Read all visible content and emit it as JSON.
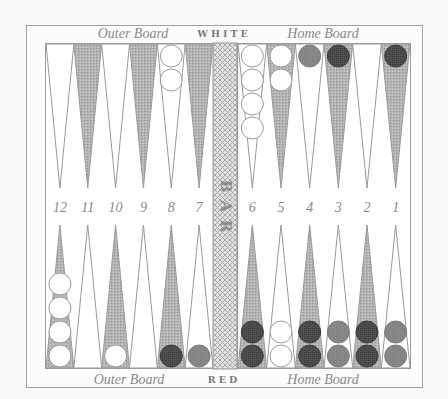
{
  "labels": {
    "top_left": "Outer Board",
    "top_center": "WHITE",
    "top_right": "Home Board",
    "bottom_left": "Outer Board",
    "bottom_center": "RED",
    "bottom_right": "Home Board",
    "bar": [
      "B",
      "A",
      "R"
    ]
  },
  "point_numbers": {
    "left": [
      "12",
      "11",
      "10",
      "9",
      "8",
      "7"
    ],
    "right": [
      "6",
      "5",
      "4",
      "3",
      "2",
      "1"
    ]
  },
  "colors": {
    "background": "#fafafa",
    "frame": "#9a9a9a",
    "shaded_point": "#a9a9a9",
    "light_point": "#ffffff",
    "bar": "#c8c8c8",
    "checker_white": "#ffffff",
    "checker_dark": "#4a4a4a",
    "checker_medium": "#858585"
  },
  "top_points": {
    "left": [
      {
        "shade": "light",
        "checkers": []
      },
      {
        "shade": "dark",
        "checkers": []
      },
      {
        "shade": "light",
        "checkers": []
      },
      {
        "shade": "dark",
        "checkers": []
      },
      {
        "shade": "light",
        "checkers": [
          "white",
          "white"
        ]
      },
      {
        "shade": "dark",
        "checkers": []
      }
    ],
    "right": [
      {
        "shade": "light",
        "checkers": [
          "white",
          "white",
          "white",
          "white"
        ]
      },
      {
        "shade": "dark",
        "checkers": [
          "white",
          "white"
        ]
      },
      {
        "shade": "light",
        "checkers": [
          "medium"
        ]
      },
      {
        "shade": "dark",
        "checkers": [
          "dark"
        ]
      },
      {
        "shade": "light",
        "checkers": []
      },
      {
        "shade": "dark",
        "checkers": [
          "dark"
        ]
      }
    ]
  },
  "bottom_points": {
    "left": [
      {
        "point": "12",
        "shade": "dark",
        "checkers": [
          "white",
          "white",
          "white",
          "white"
        ]
      },
      {
        "point": "11",
        "shade": "light",
        "checkers": []
      },
      {
        "point": "10",
        "shade": "dark",
        "checkers": [
          "white"
        ]
      },
      {
        "point": "9",
        "shade": "light",
        "checkers": []
      },
      {
        "point": "8",
        "shade": "dark",
        "checkers": [
          "dark"
        ]
      },
      {
        "point": "7",
        "shade": "light",
        "checkers": [
          "medium"
        ]
      }
    ],
    "right": [
      {
        "point": "6",
        "shade": "dark",
        "checkers": [
          "dark",
          "dark"
        ]
      },
      {
        "point": "5",
        "shade": "light",
        "checkers": [
          "white",
          "white"
        ]
      },
      {
        "point": "4",
        "shade": "dark",
        "checkers": [
          "dark",
          "dark"
        ]
      },
      {
        "point": "3",
        "shade": "light",
        "checkers": [
          "medium",
          "medium"
        ]
      },
      {
        "point": "2",
        "shade": "dark",
        "checkers": [
          "dark",
          "dark"
        ]
      },
      {
        "point": "1",
        "shade": "light",
        "checkers": [
          "medium",
          "medium"
        ]
      }
    ]
  }
}
